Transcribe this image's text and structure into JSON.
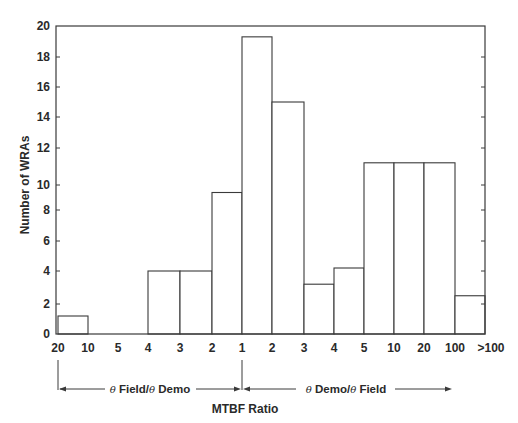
{
  "chart_data": {
    "type": "bar",
    "title": "",
    "xlabel": "MTBF Ratio",
    "ylabel": "Number of WRAs",
    "ylim": [
      0,
      20
    ],
    "yticks": [
      0,
      2,
      4,
      6,
      8,
      10,
      12,
      14,
      16,
      18,
      20
    ],
    "xtick_labels": [
      "20",
      "10",
      "5",
      "4",
      "3",
      "2",
      "1",
      "2",
      "3",
      "4",
      "5",
      "10",
      "20",
      "100",
      ">100"
    ],
    "grid": false,
    "legend": null,
    "bins": [
      {
        "from": "20",
        "to": "10",
        "side": "Field/Demo",
        "value": 1.2
      },
      {
        "from": "10",
        "to": "5",
        "side": "Field/Demo",
        "value": 0
      },
      {
        "from": "5",
        "to": "4",
        "side": "Field/Demo",
        "value": 0
      },
      {
        "from": "4",
        "to": "3",
        "side": "Field/Demo",
        "value": 4
      },
      {
        "from": "3",
        "to": "2",
        "side": "Field/Demo",
        "value": 4
      },
      {
        "from": "2",
        "to": "1",
        "side": "Field/Demo",
        "value": 9.4
      },
      {
        "from": "1",
        "to": "2",
        "side": "Demo/Field",
        "value": 19.3
      },
      {
        "from": "2",
        "to": "3",
        "side": "Demo/Field",
        "value": 15
      },
      {
        "from": "3",
        "to": "4",
        "side": "Demo/Field",
        "value": 3.2
      },
      {
        "from": "4",
        "to": "5",
        "side": "Demo/Field",
        "value": 4.2
      },
      {
        "from": "5",
        "to": "10",
        "side": "Demo/Field",
        "value": 11.2
      },
      {
        "from": "10",
        "to": "20",
        "side": "Demo/Field",
        "value": 11.2
      },
      {
        "from": "20",
        "to": "100",
        "side": "Demo/Field",
        "value": 11.2
      },
      {
        "from": "100",
        "to": ">100",
        "side": "Demo/Field",
        "value": 2.5
      }
    ],
    "annotations": [
      {
        "text_prefix": "θ",
        "text_mid": " Field/",
        "text_theta2": "θ",
        "text_suffix": " Demo",
        "range": [
          "20",
          "1"
        ]
      },
      {
        "text_prefix": "θ",
        "text_mid": " Demo/",
        "text_theta2": "θ",
        "text_suffix": " Field",
        "range": [
          "1",
          ">100"
        ]
      }
    ]
  },
  "layout": {
    "plot_left": 56,
    "plot_right": 485,
    "plot_top": 26,
    "plot_bottom": 334,
    "x_edges": [
      58,
      88,
      118,
      148,
      180,
      212,
      242,
      272,
      304,
      334,
      364,
      394,
      424,
      455,
      485
    ],
    "y_ticks_px": [
      334,
      304,
      271,
      241,
      210,
      185,
      148,
      117,
      87,
      57,
      26
    ],
    "line_color": "#3a3a3a"
  }
}
